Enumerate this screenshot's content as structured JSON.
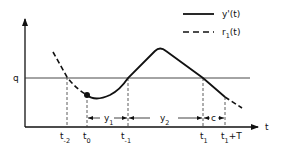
{
  "diagram": {
    "type": "timing-diagram",
    "axes": {
      "y_threshold_label": "q",
      "x_label": "t"
    },
    "legend": [
      {
        "style": "solid",
        "label": "y'(t)"
      },
      {
        "style": "dashed",
        "label_main": "r",
        "label_sub": "1",
        "label_tail": "(t)"
      }
    ],
    "time_marks": [
      {
        "main": "t",
        "sub": "-2"
      },
      {
        "main": "t",
        "sub": "0"
      },
      {
        "main": "t",
        "sub": "-1"
      },
      {
        "main": "t",
        "sub": "1"
      },
      {
        "main": "t",
        "sub": "1",
        "tail": "+T"
      }
    ],
    "intervals": [
      {
        "main": "y",
        "sub": "1",
        "from": "t0",
        "to": "t-1"
      },
      {
        "main": "y",
        "sub": "2",
        "from": "t-1",
        "to": "t1"
      },
      {
        "main": "c",
        "sub": "",
        "from": "t1",
        "to": "t1+T"
      }
    ],
    "colors": {
      "ink": "#111111",
      "background": "#ffffff"
    }
  }
}
